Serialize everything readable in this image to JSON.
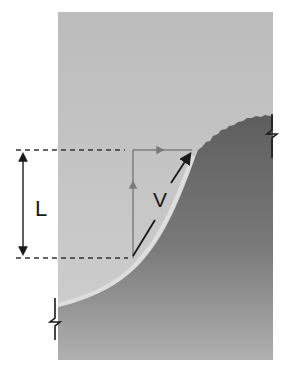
{
  "figure": {
    "type": "cross-section diagram",
    "labels": {
      "length": "L",
      "velocity": "V"
    },
    "colors": {
      "background": "#ffffff",
      "light_region": "#c4c4c4",
      "dark_region": "#6a6a6a",
      "dark_region_bottom": "#a8a8a8",
      "edge_highlight": "#dcdcdc",
      "arrow_black": "#1a1a1a",
      "arrow_gray": "#7a7a7a",
      "dashed_line": "#333333"
    },
    "elements": [
      "panel",
      "curved-slope-boundary",
      "dimension-arrow-L",
      "velocity-vector-V",
      "vertical-component-arrow",
      "horizontal-component-arrow",
      "top-dashed-guide",
      "bottom-dashed-guide",
      "break-mark-left",
      "break-mark-right"
    ]
  }
}
